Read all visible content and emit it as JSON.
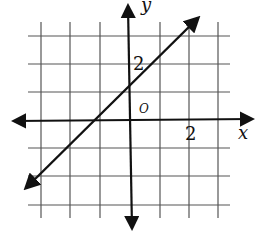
{
  "diagram": {
    "type": "coordinate-plane-line",
    "axes": {
      "x_label": "x",
      "y_label": "y",
      "origin_label": "O",
      "x_tick_label": "2",
      "y_tick_label": "2"
    },
    "grid": {
      "x_min": -3,
      "x_max": 3,
      "y_min": -3,
      "y_max": 3,
      "step": 1
    },
    "line": {
      "equation": "y = x + 1",
      "slope": 1,
      "y_intercept": 1,
      "x_intercept": -1
    },
    "colors": {
      "ink": "#111111",
      "grid": "#555555",
      "background": "#ffffff"
    }
  }
}
